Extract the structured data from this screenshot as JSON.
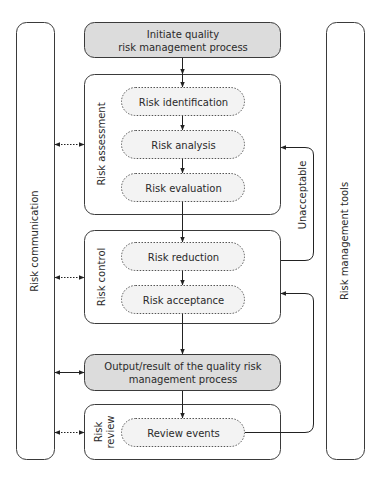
{
  "colors": {
    "stroke": "#3a3a3a",
    "gray_box_fill": "#dcdcdc",
    "pill_fill": "#f3f3f3",
    "background": "#ffffff",
    "text": "#2a2a2a"
  },
  "side_bars": {
    "left_label": "Risk communication",
    "right_label": "Risk management tools"
  },
  "start": {
    "line1": "Initiate quality",
    "line2": "risk management process"
  },
  "risk_assessment": {
    "label": "Risk assessment",
    "steps": [
      "Risk identification",
      "Risk analysis",
      "Risk evaluation"
    ]
  },
  "risk_control": {
    "label": "Risk control",
    "steps": [
      "Risk reduction",
      "Risk acceptance"
    ]
  },
  "output": {
    "line1": "Output/result of the quality risk",
    "line2": "management process"
  },
  "risk_review": {
    "label_line1": "Risk",
    "label_line2": "review",
    "steps": [
      "Review events"
    ]
  },
  "feedback": {
    "label": "Unacceptable"
  }
}
